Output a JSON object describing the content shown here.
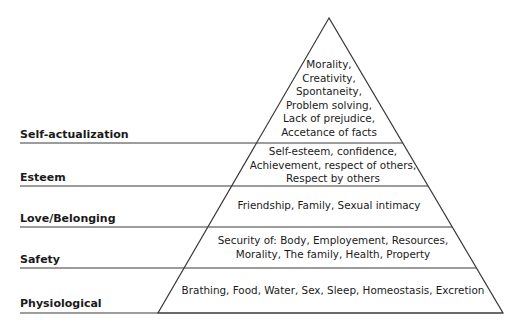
{
  "levels": [
    {
      "name": "Self-actualization",
      "lines": [
        "Morality,",
        "Creativity,",
        "Spontaneity,",
        "Problem solving,",
        "Lack of prejudice,",
        "Accetance of facts"
      ]
    },
    {
      "name": "Esteem",
      "lines": [
        "Self-esteem, confidence,",
        "Achievement, respect of others,",
        "Respect by others"
      ]
    },
    {
      "name": "Love/Belonging",
      "lines": [
        "Friendship, Family, Sexual intimacy"
      ]
    },
    {
      "name": "Safety",
      "lines": [
        "Security of: Body, Employement, Resources,",
        "Morality, The family, Health, Property"
      ]
    },
    {
      "name": "Physiological",
      "lines": [
        "Brathing, Food, Water, Sex, Sleep, Homeostasis, Excretion"
      ]
    }
  ],
  "colors": {
    "line": "#3a3a3a",
    "text": "#1a1a1a",
    "background": "#ffffff"
  }
}
